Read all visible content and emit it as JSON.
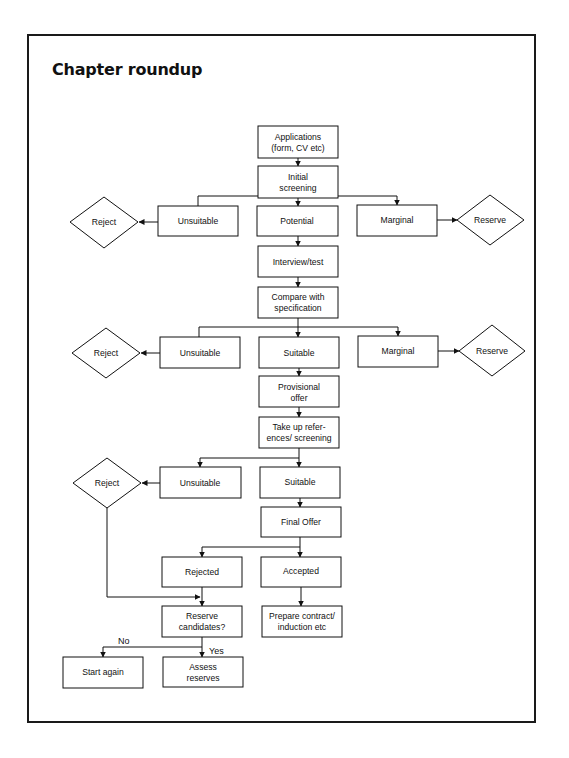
{
  "title": "Chapter roundup",
  "nodes": {
    "applications": {
      "lines": [
        "Applications",
        "(form, CV etc)"
      ],
      "shape": "box"
    },
    "initial_screening": {
      "lines": [
        "Initial",
        "screening"
      ],
      "shape": "box"
    },
    "unsuitable_1": {
      "lines": [
        "Unsuitable"
      ],
      "shape": "box"
    },
    "potential": {
      "lines": [
        "Potential"
      ],
      "shape": "box"
    },
    "marginal_1": {
      "lines": [
        "Marginal"
      ],
      "shape": "box"
    },
    "reject_1": {
      "lines": [
        "Reject"
      ],
      "shape": "diamond"
    },
    "reserve_1": {
      "lines": [
        "Reserve"
      ],
      "shape": "diamond"
    },
    "interview_test": {
      "lines": [
        "Interview/test"
      ],
      "shape": "box"
    },
    "compare_spec": {
      "lines": [
        "Compare with",
        "specification"
      ],
      "shape": "box"
    },
    "unsuitable_2": {
      "lines": [
        "Unsuitable"
      ],
      "shape": "box"
    },
    "suitable_2": {
      "lines": [
        "Suitable"
      ],
      "shape": "box"
    },
    "marginal_2": {
      "lines": [
        "Marginal"
      ],
      "shape": "box"
    },
    "reject_2": {
      "lines": [
        "Reject"
      ],
      "shape": "diamond"
    },
    "reserve_2": {
      "lines": [
        "Reserve"
      ],
      "shape": "diamond"
    },
    "provisional_offer": {
      "lines": [
        "Provisional",
        "offer"
      ],
      "shape": "box"
    },
    "take_up_refs": {
      "lines": [
        "Take up refer-",
        "ences/ screening"
      ],
      "shape": "box"
    },
    "unsuitable_3": {
      "lines": [
        "Unsuitable"
      ],
      "shape": "box"
    },
    "suitable_3": {
      "lines": [
        "Suitable"
      ],
      "shape": "box"
    },
    "reject_3": {
      "lines": [
        "Reject"
      ],
      "shape": "diamond"
    },
    "final_offer": {
      "lines": [
        "Final Offer"
      ],
      "shape": "box"
    },
    "rejected": {
      "lines": [
        "Rejected"
      ],
      "shape": "box"
    },
    "accepted": {
      "lines": [
        "Accepted"
      ],
      "shape": "box"
    },
    "reserve_candidates": {
      "lines": [
        "Reserve",
        "candidates?"
      ],
      "shape": "box"
    },
    "prepare_contract": {
      "lines": [
        "Prepare contract/",
        "induction etc"
      ],
      "shape": "box"
    },
    "start_again": {
      "lines": [
        "Start again"
      ],
      "shape": "box"
    },
    "assess_reserves": {
      "lines": [
        "Assess",
        "reserves"
      ],
      "shape": "box"
    }
  },
  "edge_labels": {
    "no": "No",
    "yes": "Yes"
  },
  "edges": [
    [
      "applications",
      "initial_screening"
    ],
    [
      "initial_screening",
      "unsuitable_1"
    ],
    [
      "initial_screening",
      "potential"
    ],
    [
      "initial_screening",
      "marginal_1"
    ],
    [
      "unsuitable_1",
      "reject_1"
    ],
    [
      "marginal_1",
      "reserve_1"
    ],
    [
      "potential",
      "interview_test"
    ],
    [
      "interview_test",
      "compare_spec"
    ],
    [
      "compare_spec",
      "unsuitable_2"
    ],
    [
      "compare_spec",
      "suitable_2"
    ],
    [
      "compare_spec",
      "marginal_2"
    ],
    [
      "unsuitable_2",
      "reject_2"
    ],
    [
      "marginal_2",
      "reserve_2"
    ],
    [
      "suitable_2",
      "provisional_offer"
    ],
    [
      "provisional_offer",
      "take_up_refs"
    ],
    [
      "take_up_refs",
      "unsuitable_3"
    ],
    [
      "take_up_refs",
      "suitable_3"
    ],
    [
      "unsuitable_3",
      "reject_3"
    ],
    [
      "suitable_3",
      "final_offer"
    ],
    [
      "final_offer",
      "rejected"
    ],
    [
      "final_offer",
      "accepted"
    ],
    [
      "reject_3",
      "reserve_candidates"
    ],
    [
      "rejected",
      "reserve_candidates"
    ],
    [
      "accepted",
      "prepare_contract"
    ],
    [
      "reserve_candidates",
      "start_again",
      "No"
    ],
    [
      "reserve_candidates",
      "assess_reserves",
      "Yes"
    ]
  ]
}
